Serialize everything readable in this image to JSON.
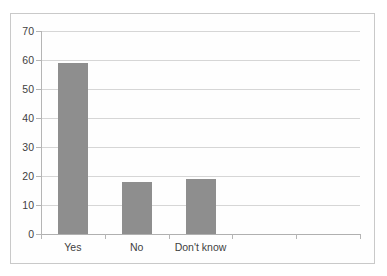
{
  "chart_data": {
    "type": "bar",
    "title": "",
    "subtitle": "",
    "xlabel": "",
    "ylabel": "",
    "categories": [
      "Yes",
      "No",
      "Don't know",
      "",
      ""
    ],
    "values": [
      59,
      18,
      19,
      null,
      null
    ],
    "series": [
      {
        "name": "",
        "values": [
          59,
          18,
          19,
          null,
          null
        ]
      }
    ],
    "ylim": [
      0,
      70
    ],
    "y_ticks": [
      0,
      10,
      20,
      30,
      40,
      50,
      60,
      70
    ],
    "y_tick_labels": [
      "0",
      "10",
      "20",
      "30",
      "40",
      "50",
      "60",
      "70"
    ],
    "x_tick_labels": [
      "Yes",
      "No",
      "Don't know",
      "",
      ""
    ],
    "grid": true,
    "grid_axis": "y",
    "legend": false,
    "legend_position": "none",
    "bar_color": "#8e8e8e",
    "grid_color": "#d6d6d6",
    "axis_color": "#b5b5b5",
    "text_color": "#3f3f3f",
    "background_color": "#ffffff",
    "frame_border_color": "#c9c9c9",
    "annotations": []
  }
}
